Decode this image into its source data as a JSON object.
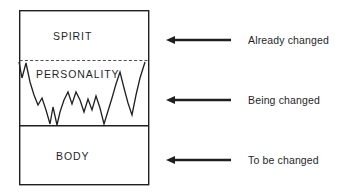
{
  "diagram": {
    "colors": {
      "stroke": "#1f1f1f",
      "background": "#ffffff",
      "dashed_divider": "#4d4d4d"
    },
    "box": {
      "x": 19,
      "y": 10,
      "width": 130,
      "height": 175,
      "border_color": "#1f1f1f",
      "border_width": 1.4
    },
    "zones": [
      {
        "key": "spirit",
        "label": "SPIRIT",
        "top_y": 10,
        "bottom_y": 60,
        "bottom_divider": "dashed"
      },
      {
        "key": "personality",
        "label": "PERSONALITY",
        "top_y": 60,
        "bottom_y": 126,
        "bottom_divider": "solid"
      },
      {
        "key": "body",
        "label": "BODY",
        "top_y": 126,
        "bottom_y": 185,
        "bottom_divider": "none"
      }
    ],
    "dividers": [
      {
        "key": "spirit-personality-divider",
        "style": "dashed",
        "y": 60
      },
      {
        "key": "personality-body-divider",
        "style": "solid",
        "y": 126
      }
    ],
    "zigzag": {
      "key": "personality-fluctuation-line",
      "description": "jagged oscillating line spanning the personality band",
      "stroke_width": 1.3,
      "points": "19,62 22,78 26,63 30,82 34,95 38,105 42,98 46,110 50,124 53,107 57,125 60,112 64,100 68,92 72,104 76,92 80,100 84,112 88,99 92,110 96,96 100,108 104,124 108,111 112,98 116,84 120,72 124,88 128,103 132,115 136,95 140,78 145,62"
    },
    "annotations": [
      {
        "key": "already-changed",
        "text": "Already changed",
        "arrow": {
          "tip_x": 166,
          "tail_x": 231,
          "y": 40
        }
      },
      {
        "key": "being-changed",
        "text": "Being changed",
        "arrow": {
          "tip_x": 166,
          "tail_x": 231,
          "y": 100
        }
      },
      {
        "key": "to-be-changed",
        "text": "To be changed",
        "arrow": {
          "tip_x": 166,
          "tail_x": 231,
          "y": 160
        }
      }
    ]
  }
}
